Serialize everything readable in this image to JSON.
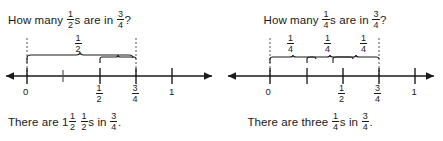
{
  "page": {
    "background": "#ffffff",
    "ink": "#1a1a1a"
  },
  "panels": [
    {
      "id": "half-panel",
      "question": {
        "prefix": "How many",
        "unit_fraction": {
          "numerator": "1",
          "denominator": "2"
        },
        "middle": "s are in",
        "target_fraction": {
          "numerator": "3",
          "denominator": "4"
        },
        "suffix": "?"
      },
      "answer": {
        "prefix": "There are",
        "count_whole": "1",
        "count_fraction": {
          "numerator": "1",
          "denominator": "2"
        },
        "unit_fraction": {
          "numerator": "1",
          "denominator": "2"
        },
        "middle": "s in",
        "target_fraction": {
          "numerator": "3",
          "denominator": "4"
        },
        "suffix": "."
      },
      "numberline": {
        "ticks": [
          {
            "value": 0,
            "label_type": "whole",
            "label": "0"
          },
          {
            "value": 0.25,
            "label_type": "none",
            "label": ""
          },
          {
            "value": 0.5,
            "label_type": "fraction",
            "numerator": "1",
            "denominator": "2"
          },
          {
            "value": 0.75,
            "label_type": "fraction",
            "numerator": "3",
            "denominator": "4"
          },
          {
            "value": 1,
            "label_type": "whole",
            "label": "1"
          }
        ],
        "guides": [
          0,
          0.75
        ],
        "braces": [
          {
            "start": 0,
            "end": 0.5,
            "label": {
              "numerator": "1",
              "denominator": "2"
            },
            "show_label": true
          },
          {
            "start": 0.5,
            "end": 0.75,
            "label": {
              "numerator": "1",
              "denominator": "2"
            },
            "show_label": false
          }
        ]
      }
    },
    {
      "id": "quarter-panel",
      "question": {
        "prefix": "How many",
        "unit_fraction": {
          "numerator": "1",
          "denominator": "4"
        },
        "middle": "s are in",
        "target_fraction": {
          "numerator": "3",
          "denominator": "4"
        },
        "suffix": "?"
      },
      "answer": {
        "prefix": "There are three",
        "count_whole": "",
        "count_fraction": null,
        "unit_fraction": {
          "numerator": "1",
          "denominator": "4"
        },
        "middle": "s in",
        "target_fraction": {
          "numerator": "3",
          "denominator": "4"
        },
        "suffix": "."
      },
      "numberline": {
        "ticks": [
          {
            "value": 0,
            "label_type": "whole",
            "label": "0"
          },
          {
            "value": 0.25,
            "label_type": "none",
            "label": ""
          },
          {
            "value": 0.5,
            "label_type": "fraction",
            "numerator": "1",
            "denominator": "2"
          },
          {
            "value": 0.75,
            "label_type": "fraction",
            "numerator": "3",
            "denominator": "4"
          },
          {
            "value": 1,
            "label_type": "whole",
            "label": "1"
          }
        ],
        "guides": [
          0,
          0.75
        ],
        "braces": [
          {
            "start": 0,
            "end": 0.25,
            "label": {
              "numerator": "1",
              "denominator": "4"
            },
            "show_label": true
          },
          {
            "start": 0.25,
            "end": 0.5,
            "label": {
              "numerator": "1",
              "denominator": "4"
            },
            "show_label": true
          },
          {
            "start": 0.5,
            "end": 0.75,
            "label": {
              "numerator": "1",
              "denominator": "4"
            },
            "show_label": true
          }
        ]
      }
    }
  ]
}
